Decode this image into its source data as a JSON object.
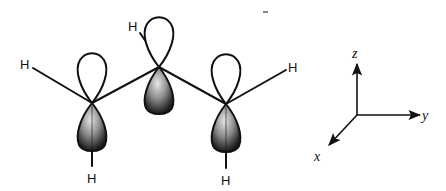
{
  "diagram": {
    "title": "",
    "atoms": [
      {
        "id": "C1",
        "label": "",
        "x": 92,
        "y": 103
      },
      {
        "id": "C2",
        "label": "",
        "x": 159,
        "y": 67
      },
      {
        "id": "C3",
        "label": "",
        "x": 226,
        "y": 104
      }
    ],
    "hydrogens": [
      {
        "id": "H1",
        "label": "H",
        "x": 26,
        "y": 69,
        "bonded_to": "C1"
      },
      {
        "id": "H2",
        "label": "H",
        "x": 92,
        "y": 183,
        "bonded_to": "C1"
      },
      {
        "id": "H3",
        "label": "H",
        "x": 134,
        "y": 31,
        "bonded_to": "C2"
      },
      {
        "id": "H4",
        "label": "H",
        "x": 293,
        "y": 72,
        "bonded_to": "C3"
      },
      {
        "id": "H5",
        "label": "H",
        "x": 226,
        "y": 185,
        "bonded_to": "C3"
      }
    ],
    "orbitals": [
      {
        "atom": "C1",
        "upper_lobe": "unshaded",
        "lower_lobe": "shaded"
      },
      {
        "atom": "C2",
        "upper_lobe": "unshaded",
        "lower_lobe": "shaded"
      },
      {
        "atom": "C3",
        "upper_lobe": "unshaded",
        "lower_lobe": "shaded"
      }
    ],
    "axes": {
      "origin": {
        "x": 357,
        "y": 115
      },
      "z_label": "z",
      "y_label": "y",
      "x_label": "x"
    },
    "colors": {
      "line": "#111111",
      "lobe_dark": "#111111",
      "lobe_light": "#cfcfcf",
      "background": "#ffffff"
    }
  }
}
